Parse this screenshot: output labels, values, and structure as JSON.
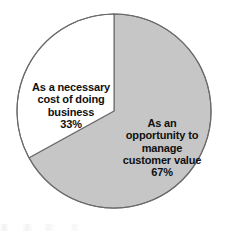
{
  "chart_data": {
    "type": "pie",
    "title": "",
    "subtitle": "",
    "xlabel": "",
    "ylabel": "",
    "legend_position": "none",
    "grid": false,
    "start_angle_deg": 0,
    "direction": "clockwise",
    "center": [
      114,
      111
    ],
    "radius": 97,
    "labels": [
      "As an opportunity to manage customer value",
      "As a necessary cost of doing business"
    ],
    "values": [
      67,
      33
    ],
    "value_unit": "%",
    "colors": [
      "#c6c6c6",
      "#ffffff"
    ],
    "outline_color": "#6b6b6b",
    "slices": [
      {
        "name": "opportunity",
        "label_lines": "As an\nopportunity to\nmanage\ncustomer value",
        "value": 67,
        "value_text": "67%",
        "color": "#c6c6c6",
        "start_deg": 0,
        "end_deg": 241.2
      },
      {
        "name": "necessary-cost",
        "label_lines": "As a necessary\ncost of doing\nbusiness",
        "value": 33,
        "value_text": "33%",
        "color": "#ffffff",
        "start_deg": 241.2,
        "end_deg": 360
      }
    ]
  },
  "figure": {
    "background_color": "#ffffff",
    "text_color": "#101010"
  }
}
